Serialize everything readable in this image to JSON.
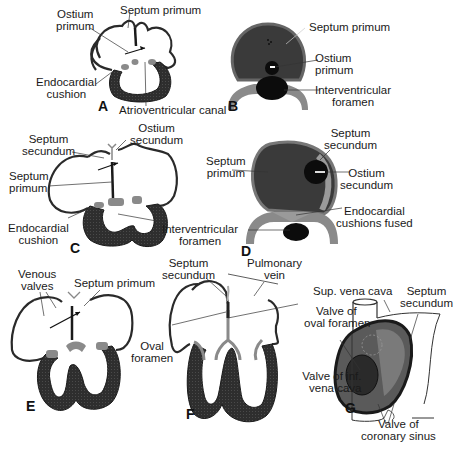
{
  "figure": {
    "colors": {
      "myocardium": "#2b2b2b",
      "cushion": "#8a8a8a",
      "septum_dark": "#3a3a3a",
      "outline": "#2a2a2a",
      "background": "#ffffff"
    },
    "panels": [
      {
        "letter": "A",
        "labels": [
          "Ostium primum",
          "Septum primum",
          "Endocardial cushion",
          "Atrioventricular canal"
        ]
      },
      {
        "letter": "B",
        "labels": [
          "Septum primum",
          "Ostium primum",
          "Interventricular foramen"
        ]
      },
      {
        "letter": "C",
        "labels": [
          "Septum secundum",
          "Ostium secundum",
          "Septum primum",
          "Endocardial cushion",
          "Interventricular foramen"
        ]
      },
      {
        "letter": "D",
        "labels": [
          "Septum primum",
          "Septum secundum",
          "Ostium secundum",
          "Endocardial cushions fused"
        ]
      },
      {
        "letter": "E",
        "labels": [
          "Venous valves",
          "Septum primum"
        ]
      },
      {
        "letter": "F",
        "labels": [
          "Septum secundum",
          "Pulmonary vein",
          "Valve of oval foramen",
          "Oval foramen"
        ]
      },
      {
        "letter": "G",
        "labels": [
          "Sup. vena cava",
          "Septum secundum",
          "Valve of inf. vena cava",
          "Valve of coronary sinus"
        ]
      }
    ]
  },
  "labels": {
    "a_ostium_primum_1": "Ostium",
    "a_ostium_primum_2": "primum",
    "a_septum_primum": "Septum primum",
    "a_endocardial_1": "Endocardial",
    "a_endocardial_2": "cushion",
    "a_av_canal": "Atrioventricular canal",
    "a_letter": "A",
    "b_septum_primum": "Septum primum",
    "b_ostium_1": "Ostium",
    "b_ostium_2": "primum",
    "b_ivf_1": "Interventricular",
    "b_ivf_2": "foramen",
    "b_letter": "B",
    "c_sept_sec_1": "Septum",
    "c_sept_sec_2": "secundum",
    "c_ost_sec_1": "Ostium",
    "c_ost_sec_2": "secundum",
    "c_sept_prim_1": "Septum",
    "c_sept_prim_2": "primum",
    "c_endo_1": "Endocardial",
    "c_endo_2": "cushion",
    "c_ivf_1": "Interventricular",
    "c_ivf_2": "foramen",
    "c_letter": "C",
    "d_sept_sec_1": "Septum",
    "d_sept_sec_2": "secundum",
    "d_sept_prim_1": "Septum",
    "d_sept_prim_2": "primum",
    "d_ost_sec_1": "Ostium",
    "d_ost_sec_2": "secundum",
    "d_endo_1": "Endocardial",
    "d_endo_2": "cushions fused",
    "d_letter": "D",
    "e_venous_1": "Venous",
    "e_venous_2": "valves",
    "e_sept_prim": "Septum primum",
    "e_letter": "E",
    "f_sept_sec_1": "Septum",
    "f_sept_sec_2": "secundum",
    "f_pulm_1": "Pulmonary",
    "f_pulm_2": "vein",
    "f_valve_1": "Valve of",
    "f_valve_2": "oval foramen",
    "f_oval_1": "Oval",
    "f_oval_2": "foramen",
    "f_letter": "F",
    "g_svc": "Sup. vena cava",
    "g_sept_sec_1": "Septum",
    "g_sept_sec_2": "secundum",
    "g_ivc_1": "Valve of inf.",
    "g_ivc_2": "vena cava",
    "g_cs_1": "Valve of",
    "g_cs_2": "coronary sinus",
    "g_letter": "G"
  }
}
